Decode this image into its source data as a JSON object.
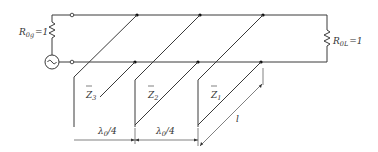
{
  "diagram": {
    "source_resistor": {
      "symbol": "R",
      "subscript": "0g",
      "value": "=1"
    },
    "load_resistor": {
      "symbol": "R",
      "subscript": "0L",
      "value": "=1"
    },
    "stubs": [
      {
        "label": "Z",
        "subscript": "3"
      },
      {
        "label": "Z",
        "subscript": "2"
      },
      {
        "label": "Z",
        "subscript": "1"
      }
    ],
    "spacing_labels": [
      {
        "text": "λ0/4",
        "main": "λ",
        "sub": "0",
        "rest": "/4"
      },
      {
        "text": "λ0/4",
        "main": "λ",
        "sub": "0",
        "rest": "/4"
      }
    ],
    "stub_length_label": "l",
    "source_icon": "ac-source-icon",
    "colors": {
      "line": "#3a3a3a",
      "text": "#333333",
      "background": "#ffffff"
    }
  }
}
